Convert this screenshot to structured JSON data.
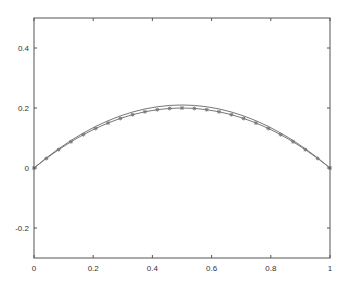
{
  "chart_data": {
    "type": "line",
    "title": "",
    "xlabel": "",
    "ylabel": "",
    "xlim": [
      0,
      1
    ],
    "ylim": [
      -0.3,
      0.5
    ],
    "grid": false,
    "legend": null,
    "x_ticks": [
      0,
      0.2,
      0.4,
      0.6,
      0.8,
      1
    ],
    "x_tick_labels": [
      "0",
      "0.2",
      "0.4",
      "0.6",
      "0.8",
      "1"
    ],
    "y_ticks": [
      -0.2,
      0,
      0.2,
      0.4
    ],
    "y_tick_labels": [
      "-0.2",
      "0",
      "0.2",
      "0.4"
    ],
    "series": [
      {
        "name": "line (no markers)",
        "style": "solid",
        "marker": "none",
        "color": "#777777",
        "x": [
          0,
          0.0417,
          0.0833,
          0.125,
          0.1667,
          0.2083,
          0.25,
          0.2917,
          0.3333,
          0.375,
          0.4167,
          0.4583,
          0.5,
          0.5417,
          0.5833,
          0.625,
          0.6667,
          0.7083,
          0.75,
          0.7917,
          0.8333,
          0.875,
          0.9167,
          0.9583,
          1
        ],
        "values": [
          0,
          0.0336,
          0.0642,
          0.0919,
          0.1167,
          0.1386,
          0.1575,
          0.1736,
          0.1867,
          0.1969,
          0.2042,
          0.2086,
          0.21,
          0.2086,
          0.2042,
          0.1969,
          0.1867,
          0.1736,
          0.1575,
          0.1386,
          0.1167,
          0.0919,
          0.0642,
          0.0336,
          0
        ]
      },
      {
        "name": "line with markers",
        "style": "solid",
        "marker": "asterisk",
        "color": "#777777",
        "x": [
          0,
          0.0417,
          0.0833,
          0.125,
          0.1667,
          0.2083,
          0.25,
          0.2917,
          0.3333,
          0.375,
          0.4167,
          0.4583,
          0.5,
          0.5417,
          0.5833,
          0.625,
          0.6667,
          0.7083,
          0.75,
          0.7917,
          0.8333,
          0.875,
          0.9167,
          0.9583,
          1
        ],
        "values": [
          0,
          0.0319,
          0.0611,
          0.0875,
          0.1111,
          0.1319,
          0.15,
          0.1653,
          0.1778,
          0.1875,
          0.1944,
          0.1986,
          0.2,
          0.1986,
          0.1944,
          0.1875,
          0.1778,
          0.1653,
          0.15,
          0.1319,
          0.1111,
          0.0875,
          0.0611,
          0.0319,
          0
        ]
      }
    ]
  },
  "axes": {
    "x_labels": [
      "0",
      "0.2",
      "0.4",
      "0.6",
      "0.8",
      "1"
    ],
    "y_labels": [
      "-0.2",
      "0",
      "0.2",
      "0.4"
    ],
    "frame_color": "#555555"
  }
}
